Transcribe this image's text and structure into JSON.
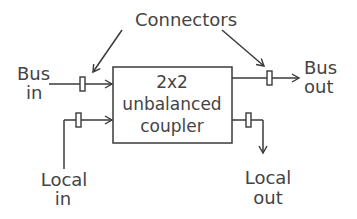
{
  "diagram": {
    "title_label": "Connectors",
    "box": {
      "line1": "2x2",
      "line2": "unbalanced",
      "line3": "coupler"
    },
    "ports": {
      "bus_in": [
        "Bus",
        "in"
      ],
      "bus_out": [
        "Bus",
        "out"
      ],
      "local_in": [
        "Local",
        "in"
      ],
      "local_out": [
        "Local",
        "out"
      ]
    },
    "colors": {
      "stroke": "#3a3a3a",
      "text": "#444444",
      "background": "#ffffff"
    }
  }
}
